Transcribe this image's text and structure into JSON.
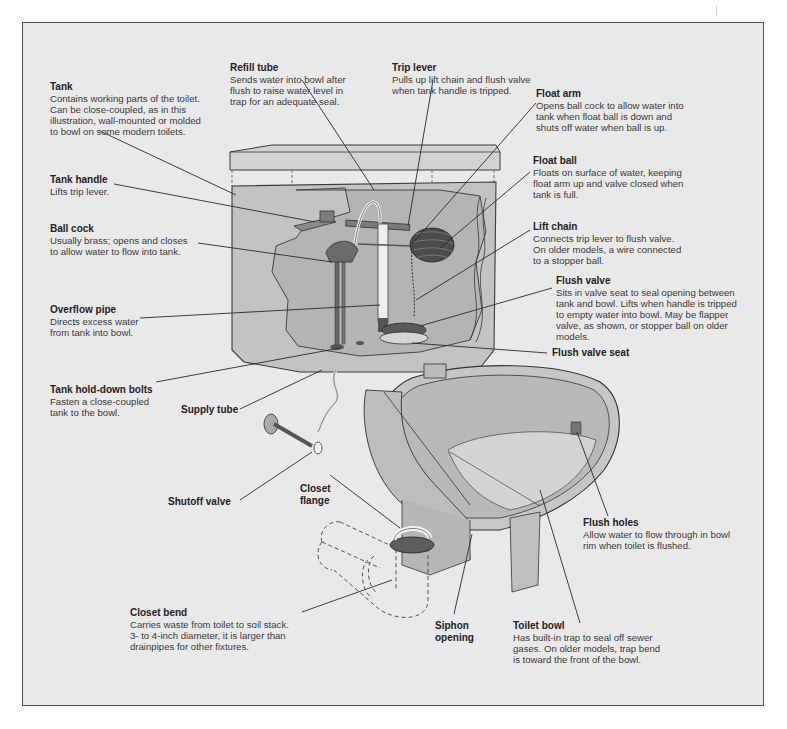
{
  "diagram": {
    "colors": {
      "background": "#e9e9e9",
      "frame_border": "#555555",
      "porcelain": "#c9c9c9",
      "porcelain_dark": "#a8a8a8",
      "metal": "#6f6f6f",
      "leader_line": "#2a2a2a"
    },
    "labels": {
      "tank": {
        "title": "Tank",
        "desc": "Contains working parts of the toilet.\nCan be close-coupled, as in this\nillustration, wall-mounted or molded\nto bowl on some modern toilets."
      },
      "refill_tube": {
        "title": "Refill tube",
        "desc": "Sends water into bowl after\nflush to raise water level in\ntrap for an adequate seal."
      },
      "trip_lever": {
        "title": "Trip lever",
        "desc": "Pulls up lift chain and flush valve\nwhen tank handle is tripped."
      },
      "float_arm": {
        "title": "Float arm",
        "desc": "Opens ball cock to allow water into\ntank when float ball is down and\nshuts off water when ball is up."
      },
      "tank_handle": {
        "title": "Tank handle",
        "desc": "Lifts trip lever."
      },
      "float_ball": {
        "title": "Float ball",
        "desc": "Floats on surface of water, keeping\nfloat arm up and valve closed when\ntank is full."
      },
      "ball_cock": {
        "title": "Ball cock",
        "desc": "Usually brass; opens and closes\nto allow water to flow into tank."
      },
      "lift_chain": {
        "title": "Lift chain",
        "desc": "Connects trip lever to flush valve.\nOn older models, a wire connected\nto a stopper ball."
      },
      "flush_valve": {
        "title": "Flush valve",
        "desc": "Sits in valve seat to seal opening between\ntank and bowl. Lifts when handle is tripped\nto empty water into bowl. May be flapper\nvalve, as shown, or stopper ball on older\nmodels."
      },
      "overflow_pipe": {
        "title": "Overflow pipe",
        "desc": "Directs excess water\nfrom tank into bowl."
      },
      "flush_valve_seat": {
        "title": "Flush valve seat"
      },
      "tank_hold_down_bolts": {
        "title": "Tank hold-down bolts",
        "desc": "Fasten a close-coupled\ntank to the bowl."
      },
      "supply_tube": {
        "title": "Supply tube"
      },
      "shutoff_valve": {
        "title": "Shutoff valve"
      },
      "closet_flange": {
        "title": "Closet\nflange"
      },
      "flush_holes": {
        "title": "Flush holes",
        "desc": "Allow water to flow through in bowl\nrim when toilet is flushed."
      },
      "closet_bend": {
        "title": "Closet bend",
        "desc": "Carries waste from toilet to soil stack.\n3- to 4-inch diameter, it is larger than\ndrainpipes for other fixtures."
      },
      "siphon_opening": {
        "title": "Siphon\nopening"
      },
      "toilet_bowl": {
        "title": "Toilet bowl",
        "desc": "Has built-in trap to seal off sewer\ngases. On older models, trap bend\nis toward the front of the bowl."
      }
    }
  }
}
